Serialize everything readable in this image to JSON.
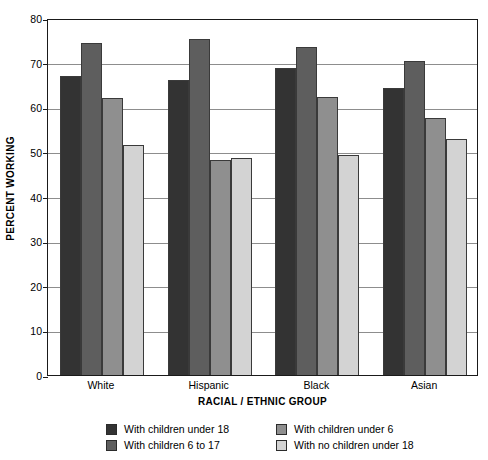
{
  "chart_data": {
    "type": "bar",
    "title": "",
    "xlabel": "RACIAL / ETHNIC GROUP",
    "ylabel": "PERCENT WORKING",
    "categories": [
      "White",
      "Hispanic",
      "Black",
      "Asian"
    ],
    "ylim": [
      0,
      80
    ],
    "yticks": [
      0,
      10,
      20,
      30,
      40,
      50,
      60,
      70,
      80
    ],
    "grid": true,
    "legend_position": "bottom",
    "series": [
      {
        "name": "With children under 18",
        "color": "#333333",
        "values": [
          67.1,
          66.0,
          68.7,
          64.4
        ]
      },
      {
        "name": "With children 6 to 17",
        "color": "#5e5e5e",
        "values": [
          74.4,
          75.2,
          73.5,
          70.4
        ]
      },
      {
        "name": "With children under 6",
        "color": "#8f8f8f",
        "values": [
          62.1,
          48.1,
          62.3,
          57.6
        ]
      },
      {
        "name": "With no children under 18",
        "color": "#d3d3d3",
        "values": [
          51.5,
          48.6,
          49.4,
          53.0
        ]
      }
    ]
  },
  "legend": {
    "entries": [
      {
        "label": "With children under 18",
        "color": "#333333"
      },
      {
        "label": "With children 6 to 17",
        "color": "#5e5e5e"
      },
      {
        "label": "With children under 6",
        "color": "#8f8f8f"
      },
      {
        "label": "With no children under 18",
        "color": "#d3d3d3"
      }
    ]
  },
  "colors": {
    "frame": "#1a1a1a",
    "gridline": "#8d8d8d",
    "background": "#ffffff"
  }
}
